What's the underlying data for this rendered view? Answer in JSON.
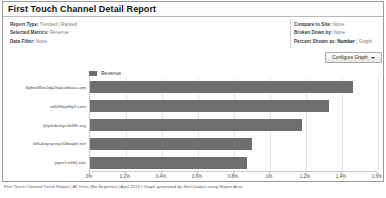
{
  "report": {
    "title": "First Touch Channel Detail Report",
    "configure_button": "Configure Graph",
    "caret_icon": "chevron-down-icon",
    "footer": "First Touch Channel Detail Report | All Visits (No Segment) | April 2013 | Graph generated by SiteCatalyst using Report Assa"
  },
  "meta_left": [
    {
      "label": "Report Type:",
      "value": "Trended | Ranked"
    },
    {
      "label": "Selected Metrics:",
      "value": "Revenue"
    },
    {
      "label": "Data Filter:",
      "value": "None"
    }
  ],
  "meta_right": [
    {
      "label": "Compare to Site:",
      "value": "None"
    },
    {
      "label": "Broken Down by:",
      "value": "None"
    },
    {
      "label": "Percent Shown as:",
      "value": "Number",
      "value2": "Graph"
    }
  ],
  "colors": {
    "bar": "#6e6e6e",
    "grid": "#e4e4e4",
    "axis": "#c9c9c9",
    "frame": "#9a9a9a"
  },
  "chart_data": {
    "type": "bar",
    "orientation": "horizontal",
    "title": "",
    "xlabel": "",
    "ylabel": "",
    "legend": [
      "Revenue"
    ],
    "legend_position": "top-left",
    "grid": true,
    "xlim": [
      0,
      1.6
    ],
    "xticks": [
      "0%",
      "0.2%",
      "0.4%",
      "0.6%",
      "0.8%",
      "1%",
      "1.2%",
      "1.4%",
      "1.6%"
    ],
    "xtick_values": [
      0,
      0.2,
      0.4,
      0.6,
      0.8,
      1.0,
      1.2,
      1.4,
      1.6
    ],
    "categories": [
      "3gffw0f6te2dp2lupsebkaa.com",
      "w3t3ffwp9q2l.com",
      "tj0p4sbchycrb48h.org",
      "b9a4wysysey1f4bopjkf.net",
      "jvpm1rx66lj.edu"
    ],
    "series": [
      {
        "name": "Revenue",
        "values": [
          1.46,
          1.33,
          1.18,
          0.9,
          0.87
        ]
      }
    ]
  }
}
